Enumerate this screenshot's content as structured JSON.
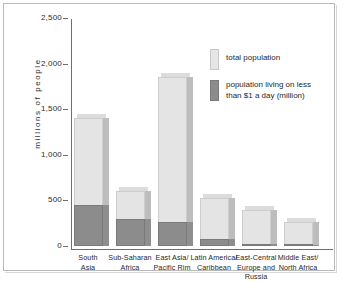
{
  "chart_data": {
    "type": "bar",
    "title": "",
    "subtitle": "",
    "xlabel": "",
    "ylabel": "millions of people",
    "ylim": [
      0,
      2500
    ],
    "yticks": [
      0,
      500,
      1000,
      1500,
      2000,
      2500
    ],
    "ytick_labels": [
      "0",
      "500",
      "1,000",
      "1,500",
      "2,000",
      "2,500"
    ],
    "grid": false,
    "legend_position": "upper right",
    "categories": [
      "South Asia",
      "Sub-Saharan Africa",
      "East Asia/ Pacific Rim",
      "Latin America/ Caribbean",
      "East-Central Europe and Russia",
      "Middle East/ North Africa"
    ],
    "category_lines": [
      [
        "South",
        "Asia"
      ],
      [
        "Sub-Saharan",
        "Africa"
      ],
      [
        "East Asia/",
        "Pacific Rim"
      ],
      [
        "Latin America/",
        "Caribbean"
      ],
      [
        "East-Central",
        "Europe and Russia"
      ],
      [
        "Middle East/",
        "North Africa"
      ]
    ],
    "series": [
      {
        "name": "total population",
        "color": "#e4e4e4",
        "values": [
          1400,
          600,
          1850,
          525,
          395,
          260
        ]
      },
      {
        "name": "population living on less than $1 a day (million)",
        "color": "#8c8c8c",
        "values": [
          450,
          295,
          265,
          75,
          17,
          10
        ]
      }
    ]
  },
  "legend": {
    "entries": [
      {
        "label": "total population",
        "swatch": "total"
      },
      {
        "label_line1": "population living on less",
        "label_line2": "than $1 a day (million)",
        "swatch": "poor"
      }
    ]
  },
  "colors": {
    "total_bar": "#e4e4e4",
    "poor_bar": "#8c8c8c",
    "axis": "#6e6e6e",
    "frame": "#b9b9b9",
    "text": "#1f1f1f",
    "background": "#ffffff"
  }
}
